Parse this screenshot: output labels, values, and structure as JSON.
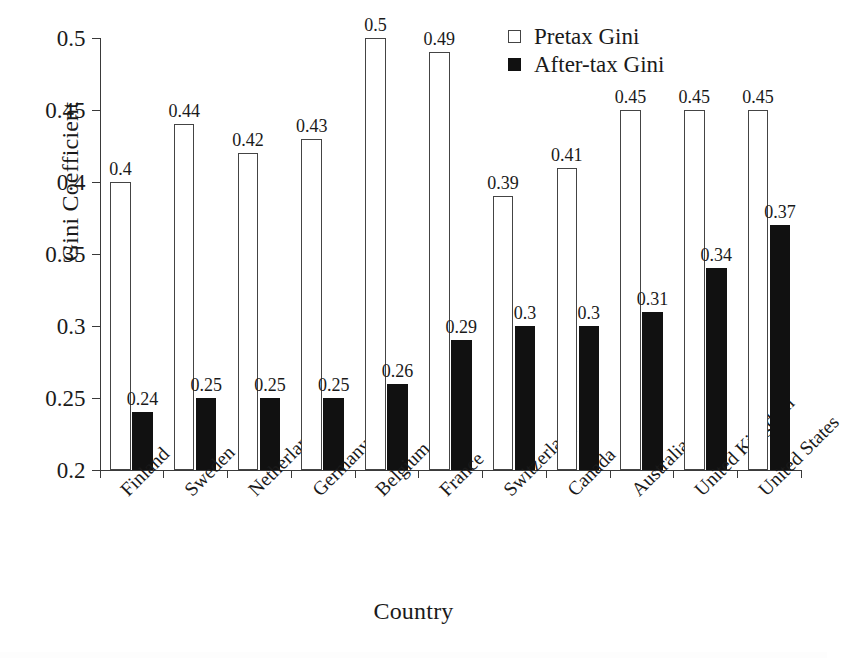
{
  "chart_data": {
    "type": "bar",
    "title": "",
    "xlabel": "Country",
    "ylabel": "Gini Coefficient",
    "ylim": [
      0.2,
      0.5
    ],
    "yticks": [
      0.2,
      0.25,
      0.3,
      0.35,
      0.4,
      0.45,
      0.5
    ],
    "ytick_labels": [
      "0.2",
      "0.25",
      "0.3",
      "0.35",
      "0.4",
      "0.45",
      "0.5"
    ],
    "grid": false,
    "legend_position": "top-right",
    "categories": [
      "Finland",
      "Sweden",
      "Netherlands",
      "Germany",
      "Belgium",
      "France",
      "Switzerland",
      "Canada",
      "Australia",
      "United Kingdom",
      "United States"
    ],
    "series": [
      {
        "name": "Pretax Gini",
        "color": "#ffffff",
        "edge_color": "#444444",
        "values": [
          0.4,
          0.44,
          0.42,
          0.43,
          0.5,
          0.49,
          0.39,
          0.41,
          0.45,
          0.45,
          0.45
        ],
        "labels": [
          "0.4",
          "0.44",
          "0.42",
          "0.43",
          "0.5",
          "0.49",
          "0.39",
          "0.41",
          "0.45",
          "0.45",
          "0.45"
        ]
      },
      {
        "name": "After-tax Gini",
        "color": "#111111",
        "edge_color": "#111111",
        "values": [
          0.24,
          0.25,
          0.25,
          0.25,
          0.26,
          0.29,
          0.3,
          0.3,
          0.31,
          0.34,
          0.37
        ],
        "labels": [
          "0.24",
          "0.25",
          "0.25",
          "0.25",
          "0.26",
          "0.29",
          "0.3",
          "0.3",
          "0.31",
          "0.34",
          "0.37"
        ]
      }
    ]
  },
  "legend": {
    "items": [
      {
        "label": "Pretax Gini",
        "swatch": "hollow-square-icon"
      },
      {
        "label": "After-tax Gini",
        "swatch": "filled-square-icon"
      }
    ]
  },
  "axes": {
    "y_title": "Gini Coefficient",
    "x_title": "Country"
  }
}
